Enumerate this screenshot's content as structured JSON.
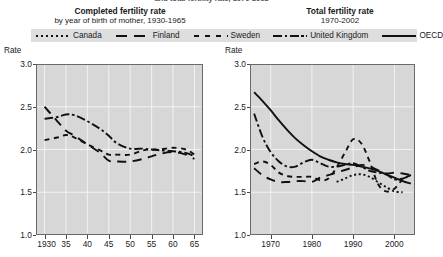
{
  "banner": {
    "cut_text": "and total fertility rate, 1970-2002"
  },
  "panels": {
    "left": {
      "title": "Completed fertility rate",
      "subtitle": "by year of birth of mother, 1930-1965",
      "rate_caption": "Rate"
    },
    "right": {
      "title": "Total fertility rate",
      "subtitle": "1970-2002",
      "rate_caption": "Rate"
    }
  },
  "legend": [
    {
      "label": "Canada",
      "style": "dotted"
    },
    {
      "label": "Finland",
      "style": "long-dash"
    },
    {
      "label": "Sweden",
      "style": "medium-dash"
    },
    {
      "label": "United Kingdom",
      "style": "dash-dot"
    },
    {
      "label": "OECD",
      "style": "solid"
    }
  ],
  "colors": {
    "plot_background": "#d7d7d7",
    "line": "#111111",
    "gridline": "#f2f2f2",
    "legend_background": "#dedede",
    "axis": "#6a6a6a"
  },
  "chart_data": [
    {
      "type": "line",
      "title": "Completed fertility rate",
      "subtitle": "by year of birth of mother, 1930-1965",
      "xlabel": "",
      "ylabel": "Rate",
      "xlim": [
        1928,
        1967
      ],
      "ylim": [
        1.0,
        3.0
      ],
      "yticks": [
        1.0,
        1.5,
        2.0,
        2.5,
        3.0
      ],
      "ytick_labels": [
        "1.0",
        "1.5",
        "2.0",
        "2.5",
        "3.0"
      ],
      "xticks": [
        1930,
        1935,
        1940,
        1945,
        1950,
        1955,
        1960,
        1965
      ],
      "xtick_labels": [
        "1930",
        "35",
        "40",
        "45",
        "50",
        "55",
        "60",
        "65"
      ],
      "grid": true,
      "legend_position": "above-shared",
      "series": [
        {
          "name": "Sweden",
          "style": "medium-dash",
          "x": [
            1930,
            1933,
            1935,
            1937,
            1940,
            1943,
            1945,
            1947,
            1950,
            1953,
            1955,
            1957,
            1960,
            1963,
            1965
          ],
          "values": [
            2.11,
            2.14,
            2.17,
            2.14,
            2.06,
            1.99,
            1.94,
            1.94,
            1.94,
            1.99,
            2.0,
            2.0,
            2.02,
            2.0,
            1.94
          ]
        },
        {
          "name": "Finland",
          "style": "long-dash",
          "x": [
            1930,
            1933,
            1935,
            1937,
            1940,
            1943,
            1945,
            1947,
            1950,
            1953,
            1955,
            1957,
            1960,
            1963,
            1965
          ],
          "values": [
            2.5,
            2.33,
            2.22,
            2.16,
            2.06,
            1.96,
            1.87,
            1.86,
            1.86,
            1.89,
            1.92,
            1.95,
            1.97,
            1.94,
            1.89
          ]
        },
        {
          "name": "United Kingdom",
          "style": "dash-dot",
          "x": [
            1930,
            1933,
            1935,
            1937,
            1940,
            1943,
            1945,
            1947,
            1950,
            1953,
            1955,
            1957,
            1960,
            1963,
            1965
          ],
          "values": [
            2.36,
            2.38,
            2.41,
            2.4,
            2.33,
            2.24,
            2.16,
            2.07,
            2.01,
            2.01,
            2.0,
            1.99,
            1.98,
            1.96,
            1.92
          ]
        }
      ]
    },
    {
      "type": "line",
      "title": "Total fertility rate",
      "subtitle": "1970-2002",
      "xlabel": "",
      "ylabel": "Rate",
      "xlim": [
        1965,
        2005
      ],
      "ylim": [
        1.0,
        3.0
      ],
      "yticks": [
        1.0,
        1.5,
        2.0,
        2.5,
        3.0
      ],
      "ytick_labels": [
        "1.0",
        "1.5",
        "2.0",
        "2.5",
        "3.0"
      ],
      "xticks": [
        1970,
        1980,
        1990,
        2000
      ],
      "xtick_labels": [
        "1970",
        "1980",
        "1990",
        "2000"
      ],
      "grid": true,
      "legend_position": "above-shared",
      "series": [
        {
          "name": "OECD",
          "style": "solid",
          "x": [
            1966,
            1968,
            1970,
            1972,
            1974,
            1976,
            1978,
            1980,
            1982,
            1984,
            1986,
            1988,
            1990,
            1992,
            1994,
            1996,
            1998,
            2000,
            2002,
            2004
          ],
          "values": [
            2.67,
            2.57,
            2.46,
            2.34,
            2.23,
            2.13,
            2.05,
            1.98,
            1.92,
            1.88,
            1.85,
            1.83,
            1.82,
            1.8,
            1.78,
            1.75,
            1.71,
            1.67,
            1.63,
            1.6
          ]
        },
        {
          "name": "United Kingdom",
          "style": "dash-dot",
          "x": [
            1966,
            1968,
            1970,
            1972,
            1974,
            1976,
            1978,
            1980,
            1982,
            1984,
            1986,
            1988,
            1990,
            1992,
            1994,
            1996,
            1998,
            2000,
            2002,
            2004
          ],
          "values": [
            2.42,
            2.15,
            1.97,
            1.86,
            1.8,
            1.8,
            1.85,
            1.88,
            1.84,
            1.8,
            1.8,
            1.82,
            1.84,
            1.8,
            1.75,
            1.73,
            1.71,
            1.65,
            1.66,
            1.7
          ]
        },
        {
          "name": "Sweden",
          "style": "medium-dash",
          "x": [
            1966,
            1968,
            1970,
            1972,
            1974,
            1976,
            1978,
            1980,
            1982,
            1984,
            1986,
            1988,
            1990,
            1992,
            1994,
            1996,
            1998,
            2000,
            2002,
            2004
          ],
          "values": [
            1.83,
            1.86,
            1.82,
            1.73,
            1.69,
            1.68,
            1.68,
            1.68,
            1.64,
            1.66,
            1.79,
            1.96,
            2.12,
            2.07,
            1.86,
            1.6,
            1.51,
            1.54,
            1.65,
            1.7
          ]
        },
        {
          "name": "Finland",
          "style": "long-dash",
          "x": [
            1966,
            1968,
            1970,
            1972,
            1974,
            1976,
            1978,
            1980,
            1982,
            1984,
            1986,
            1988,
            1990,
            1992,
            1994,
            1996,
            1998,
            2000,
            2002,
            2004
          ],
          "values": [
            1.78,
            1.7,
            1.65,
            1.62,
            1.62,
            1.63,
            1.63,
            1.62,
            1.67,
            1.7,
            1.73,
            1.76,
            1.79,
            1.82,
            1.8,
            1.76,
            1.72,
            1.73,
            1.72,
            1.7
          ]
        },
        {
          "name": "Canada",
          "style": "dotted",
          "x": [
            1986,
            1988,
            1990,
            1992,
            1994,
            1996,
            1998,
            2000,
            2002
          ],
          "values": [
            1.62,
            1.66,
            1.7,
            1.71,
            1.68,
            1.62,
            1.56,
            1.51,
            1.5
          ]
        }
      ]
    }
  ]
}
